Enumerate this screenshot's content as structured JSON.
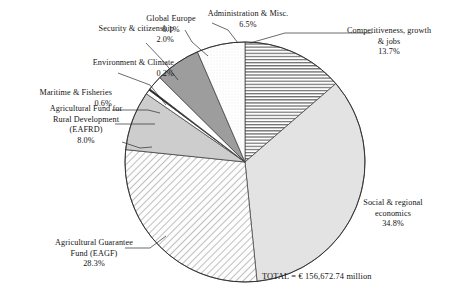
{
  "chart_data": {
    "type": "pie",
    "title": "",
    "subtitle": "",
    "xlabel": "",
    "ylabel": "",
    "legend_position": "none",
    "grid": false,
    "total_label": "TOTAL = € 156,672.74 million",
    "total_value": 156672.74,
    "total_currency": "€",
    "total_units": "million",
    "start_angle_deg": 0,
    "direction": "clockwise",
    "categories": [
      "Competitiveness, growth & jobs",
      "Social & regional economics",
      "Agricultural Guarantee Fund (EAGF)",
      "Agricultural Fund for Rural Development (EAFRD)",
      "Maritime & Fisheries",
      "Environment & Climate",
      "Security & citizenship",
      "Global Europe",
      "Administration & Misc."
    ],
    "values": [
      13.7,
      34.8,
      28.3,
      8.0,
      0.6,
      0.2,
      2.0,
      6.1,
      6.5
    ],
    "value_labels": [
      "13.7%",
      "34.8%",
      "28.3%",
      "8.0%",
      "0.6%",
      "0.2%",
      "2.0%",
      "6.1%",
      "6.5%"
    ],
    "slices": [
      {
        "name": "Competitiveness, growth & jobs",
        "label_lines": "Competitiveness, growth\n& jobs\n13.7%",
        "value": 13.7,
        "value_label": "13.7%",
        "fill": "horizontal-hatch",
        "color": "#ffffff"
      },
      {
        "name": "Social & regional economics",
        "label_lines": "Social & regional\neconomics\n34.8%",
        "value": 34.8,
        "value_label": "34.8%",
        "fill": "solid",
        "color": "#e3e3e3"
      },
      {
        "name": "Agricultural Guarantee Fund (EAGF)",
        "label_lines": "Agricultural  Guarantee\nFund (EAGF)\n28.3%",
        "value": 28.3,
        "value_label": "28.3%",
        "fill": "diagonal-hatch",
        "color": "#fbfbfb"
      },
      {
        "name": "Agricultural Fund for Rural Development (EAFRD)",
        "label_lines": "Agricultural  Fund for\nRural Development\n(EAFRD)\n8.0%",
        "value": 8.0,
        "value_label": "8.0%",
        "fill": "solid",
        "color": "#cdcdcd"
      },
      {
        "name": "Maritime & Fisheries",
        "label_lines": "Maritime  & Fisheries\n0.6%",
        "value": 0.6,
        "value_label": "0.6%",
        "fill": "solid",
        "color": "#ffffff"
      },
      {
        "name": "Environment & Climate",
        "label_lines": "Environment  & Climate\n0.2%",
        "value": 0.2,
        "value_label": "0.2%",
        "fill": "solid",
        "color": "#1c1c1c"
      },
      {
        "name": "Security & citizenship",
        "label_lines": "Security & citizenship\n2.0%",
        "value": 2.0,
        "value_label": "2.0%",
        "fill": "solid",
        "color": "#ffffff"
      },
      {
        "name": "Global Europe",
        "label_lines": "Global Europe\n6.1%",
        "value": 6.1,
        "value_label": "6.1%",
        "fill": "solid",
        "color": "#9d9d9d"
      },
      {
        "name": "Administration & Misc.",
        "label_lines": "Administration  & Misc.\n6.5%",
        "value": 6.5,
        "value_label": "6.5%",
        "fill": "dotted",
        "color": "#fbfbfb"
      }
    ]
  }
}
